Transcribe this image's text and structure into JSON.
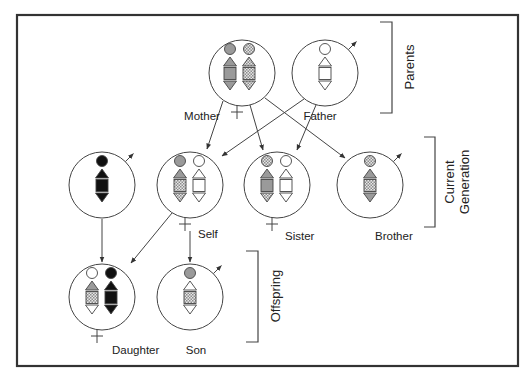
{
  "diagram": {
    "type": "pedigree-chromosome-inheritance",
    "frame": {
      "x": 17,
      "y": 15,
      "w": 501,
      "h": 351
    },
    "colors": {
      "line": "#444444",
      "gray": "#9a9a9a",
      "black": "#111111",
      "white": "#ffffff",
      "pattern_bg": "#e8e8e8",
      "pattern_dot": "#8c8c8c"
    },
    "generations": [
      {
        "id": "parents",
        "label": "Parents",
        "bracket": {
          "x": 392,
          "y1": 22,
          "y2": 113,
          "tick": 12
        }
      },
      {
        "id": "current",
        "label_lines": [
          "Current",
          "Generation"
        ],
        "bracket": {
          "x": 435,
          "y1": 137,
          "y2": 227,
          "tick": 11
        }
      },
      {
        "id": "offspring",
        "label": "Offspring",
        "bracket": {
          "x": 258,
          "y1": 251,
          "y2": 342,
          "tick": 12
        }
      }
    ],
    "people": [
      {
        "id": "mother",
        "label": "Mother",
        "sex": "female",
        "cx": 242,
        "cy": 73,
        "label_pos": {
          "x": 202,
          "y": 120,
          "anchor": "middle"
        },
        "columns": [
          {
            "dx": -12,
            "fills": [
              "gray",
              "gray",
              "gray",
              "gray"
            ]
          },
          {
            "dx": 7,
            "fills": [
              "pattern",
              "pattern",
              "pattern",
              "pattern"
            ]
          }
        ]
      },
      {
        "id": "father",
        "label": "Father",
        "sex": "male",
        "cx": 325,
        "cy": 73,
        "label_pos": {
          "x": 320,
          "y": 120,
          "anchor": "middle"
        },
        "columns": [
          {
            "dx": 0,
            "fills": [
              "white",
              "white",
              "white",
              "white"
            ]
          }
        ]
      },
      {
        "id": "spouse",
        "label": "",
        "sex": "male",
        "cx": 102,
        "cy": 185,
        "columns": [
          {
            "dx": 0,
            "fills": [
              "black",
              "black",
              "black",
              "black"
            ]
          }
        ]
      },
      {
        "id": "self",
        "label": "Self",
        "sex": "female",
        "cx": 190,
        "cy": 185,
        "label_pos": {
          "x": 198,
          "y": 238,
          "anchor": "start"
        },
        "columns": [
          {
            "dx": -10,
            "fills": [
              "gray",
              "gray",
              "pattern",
              "pattern"
            ]
          },
          {
            "dx": 9,
            "fills": [
              "white",
              "white",
              "white",
              "white"
            ]
          }
        ]
      },
      {
        "id": "sister",
        "label": "Sister",
        "sex": "female",
        "cx": 277,
        "cy": 185,
        "label_pos": {
          "x": 285,
          "y": 240,
          "anchor": "start"
        },
        "columns": [
          {
            "dx": -10,
            "fills": [
              "pattern",
              "gray",
              "gray",
              "pattern"
            ]
          },
          {
            "dx": 9,
            "fills": [
              "white",
              "white",
              "white",
              "white"
            ]
          }
        ]
      },
      {
        "id": "brother",
        "label": "Brother",
        "sex": "male",
        "cx": 370,
        "cy": 185,
        "label_pos": {
          "x": 375,
          "y": 240,
          "anchor": "start"
        },
        "columns": [
          {
            "dx": 0,
            "fills": [
              "pattern",
              "gray",
              "pattern",
              "gray"
            ]
          }
        ]
      },
      {
        "id": "daughter",
        "label": "Daughter",
        "sex": "female",
        "cx": 102,
        "cy": 297,
        "label_pos": {
          "x": 112,
          "y": 354,
          "anchor": "start"
        },
        "columns": [
          {
            "dx": -10,
            "fills": [
              "white",
              "gray",
              "pattern",
              "white"
            ]
          },
          {
            "dx": 9,
            "fills": [
              "black",
              "black",
              "black",
              "black"
            ]
          }
        ]
      },
      {
        "id": "son",
        "label": "Son",
        "sex": "male",
        "cx": 190,
        "cy": 297,
        "label_pos": {
          "x": 196,
          "y": 354,
          "anchor": "middle"
        },
        "columns": [
          {
            "dx": 0,
            "fills": [
              "gray",
              "white",
              "pattern",
              "white"
            ]
          }
        ]
      }
    ],
    "radius": 33,
    "arrows": [
      {
        "from": "mother",
        "to": "self",
        "x1": 223,
        "y1": 101,
        "x2": 207,
        "y2": 149
      },
      {
        "from": "mother",
        "to": "sister",
        "x1": 250,
        "y1": 105,
        "x2": 263,
        "y2": 150
      },
      {
        "from": "mother",
        "to": "brother",
        "x1": 265,
        "y1": 98,
        "x2": 345,
        "y2": 158
      },
      {
        "from": "father",
        "to": "self",
        "x1": 304,
        "y1": 99,
        "x2": 222,
        "y2": 156
      },
      {
        "from": "father",
        "to": "sister",
        "x1": 316,
        "y1": 105,
        "x2": 297,
        "y2": 150
      },
      {
        "from": "spouse",
        "to": "daughter",
        "x1": 102,
        "y1": 219,
        "x2": 102,
        "y2": 262
      },
      {
        "from": "self",
        "to": "daughter",
        "x1": 172,
        "y1": 213,
        "x2": 131,
        "y2": 263
      },
      {
        "from": "self",
        "to": "son",
        "x1": 190,
        "y1": 231,
        "x2": 190,
        "y2": 262
      }
    ]
  }
}
